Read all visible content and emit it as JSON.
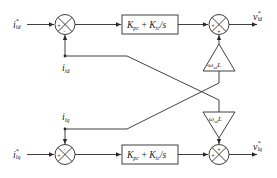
{
  "diagram": {
    "type": "block-diagram",
    "inputs": {
      "d_ref": "i*ld",
      "q_ref": "i*lq",
      "d_feedback": "ild",
      "q_feedback": "ilq"
    },
    "labels": {
      "d_ref_main": "i",
      "d_ref_sup": "*",
      "d_ref_sub": "ld",
      "q_ref_main": "i",
      "q_ref_sup": "*",
      "q_ref_sub": "lq",
      "d_fb_main": "i",
      "d_fb_sub": "ld",
      "q_fb_main": "i",
      "q_fb_sub": "lq",
      "d_out_main": "v",
      "d_out_sup": "*",
      "d_out_sub": "ld",
      "q_out_main": "v",
      "q_out_sup": "*",
      "q_out_sub": "lq"
    },
    "blocks": {
      "pi_d": "Kpc + Kic/s",
      "pi_q": "Kpc + Kic/s",
      "gain_d": "-ωsdL",
      "gain_q": "ωsdL"
    },
    "pi_text": {
      "k1": "K",
      "k1_sub": "pc",
      "plus": " + ",
      "k2": "K",
      "k2_sub": "ic",
      "tail": "/s"
    },
    "gain_text": {
      "neg": "-ω",
      "pos": "ω",
      "sub": "sd",
      "L": "L"
    },
    "summing_junctions": {
      "sum1_d": {
        "left": "+",
        "bottom": "-"
      },
      "sum1_q": {
        "left": "+",
        "top": "-"
      },
      "sum2_d": {
        "left": "+",
        "bottom": "+"
      },
      "sum2_q": {
        "left": "+",
        "top": "+"
      }
    }
  }
}
